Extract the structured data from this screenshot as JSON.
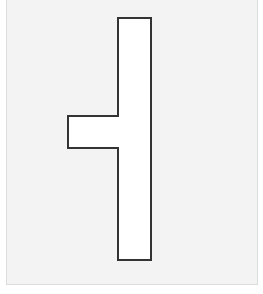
{
  "diagram": {
    "background_color": "#f3f3f3",
    "shape": {
      "type": "t-shaped-polygon",
      "fill": "#ffffff",
      "stroke": "#333333",
      "stroke_width": 2,
      "points": "118,18 151,18 151,260 118,260 118,148 68,148 68,116 118,116"
    }
  }
}
